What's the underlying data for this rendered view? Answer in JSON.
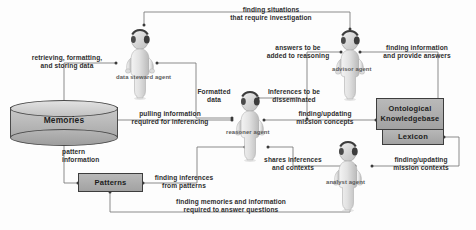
{
  "diagram": {
    "nodes": {
      "memories": {
        "label": "Memories",
        "type": "cylinder"
      },
      "patterns": {
        "label": "Patterns",
        "type": "box"
      },
      "ontological_kb": {
        "label_line1": "Ontological",
        "label_line2": "Knowledgebase",
        "type": "box"
      },
      "lexicon": {
        "label": "Lexicon",
        "type": "box"
      }
    },
    "agents": [
      {
        "id": "data-steward-agent",
        "caption": "data steward agent"
      },
      {
        "id": "advisor-agent",
        "caption": "advisor agent"
      },
      {
        "id": "reasoner-agent",
        "caption": "reasoner agent"
      },
      {
        "id": "analyst-agent",
        "caption": "analyst agent"
      }
    ],
    "edge_labels": [
      {
        "id": "finding-situations",
        "line1": "finding situations",
        "line2": "that require investigation"
      },
      {
        "id": "retrieving-formatting",
        "line1": "retrieving, formatting,",
        "line2": "and storing data"
      },
      {
        "id": "answers-to-be-added",
        "line1": "answers to be",
        "line2": "added to reasoning"
      },
      {
        "id": "finding-information",
        "line1": "finding information",
        "line2": "and provide answers"
      },
      {
        "id": "formatted-data",
        "line1": "Formatted",
        "line2": "data"
      },
      {
        "id": "inferences-disseminated",
        "line1": "Inferences to be",
        "line2": "disseminated"
      },
      {
        "id": "pulling-information",
        "line1": "pulling information",
        "line2": "required for inferencing"
      },
      {
        "id": "finding-updating-concepts",
        "line1": "finding/updating",
        "line2": "mission concepts"
      },
      {
        "id": "pattern-information",
        "line1": "pattern",
        "line2": "information"
      },
      {
        "id": "finding-inferences",
        "line1": "finding inferences",
        "line2": "from patterns"
      },
      {
        "id": "shares-inferences",
        "line1": "shares inferences",
        "line2": "and contexts"
      },
      {
        "id": "finding-updating-contexts",
        "line1": "finding/updating",
        "line2": "mission contexts"
      },
      {
        "id": "finding-memories",
        "line1": "finding memories and information",
        "line2": "required to answer questions"
      }
    ],
    "colors": {
      "line": "#6f6f6f",
      "node_fill": "#ababab",
      "node_stroke": "#3d3d3d",
      "text": "#2e2e2e",
      "caption": "#5a5a5a",
      "background": "#ffffff"
    }
  }
}
